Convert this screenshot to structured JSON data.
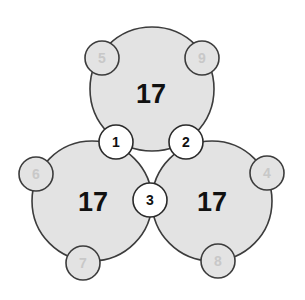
{
  "puzzle": {
    "big_circles": [
      {
        "id": "top",
        "sum": "17"
      },
      {
        "id": "left",
        "sum": "17"
      },
      {
        "id": "right",
        "sum": "17"
      }
    ],
    "shared_nodes": [
      {
        "label": "1"
      },
      {
        "label": "2"
      },
      {
        "label": "3"
      }
    ],
    "outer_nodes": [
      {
        "label": "5"
      },
      {
        "label": "9"
      },
      {
        "label": "6"
      },
      {
        "label": "7"
      },
      {
        "label": "4"
      },
      {
        "label": "8"
      }
    ]
  },
  "colors": {
    "circle_fill": "#e3e3e3",
    "stroke": "#3c3c3c",
    "shared_fill": "#ffffff",
    "faint_number": "#c8c8c8"
  }
}
